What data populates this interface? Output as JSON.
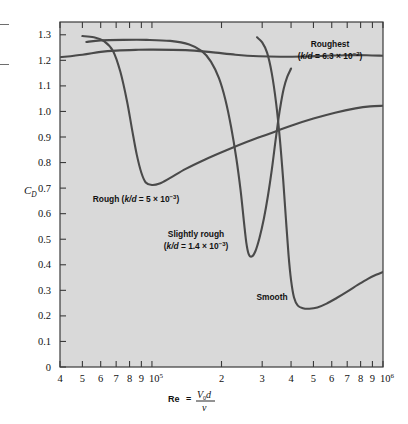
{
  "figure": {
    "background": "#ffffff",
    "plot_background": "#d9d9d9",
    "curve_color": "#4a4a4a",
    "frame_color": "#3a3a3a"
  },
  "chart_data": {
    "type": "line",
    "title": "",
    "subtitle": "",
    "xlabel": "Re = V₀d/ν",
    "xlabel_parts": {
      "prefix": "Re",
      "equals": "=",
      "numerator_v": "V",
      "numerator_sub": "0",
      "numerator_d": "d",
      "denominator": "ν"
    },
    "ylabel": "C_D",
    "ylabel_parts": {
      "main": "C",
      "sub": "D"
    },
    "xscale": "log",
    "yscale": "linear",
    "xlim": [
      40000,
      1000000
    ],
    "ylim": [
      0,
      1.35
    ],
    "grid": false,
    "legend_position": "inline-annotations",
    "ytick_labels": [
      "0",
      "0.1",
      "0.2",
      "0.3",
      "0.4",
      "0.5",
      "0.6",
      "0.7",
      "0.8",
      "0.9",
      "1.0",
      "1.1",
      "1.2",
      "1.3"
    ],
    "ytick_values": [
      0,
      0.1,
      0.2,
      0.3,
      0.4,
      0.5,
      0.6,
      0.7,
      0.8,
      0.9,
      1.0,
      1.1,
      1.2,
      1.3
    ],
    "xtick_labels": [
      "4",
      "5",
      "6",
      "7",
      "8",
      "9",
      "10⁵",
      "2",
      "3",
      "4",
      "5",
      "6",
      "7",
      "8",
      "9",
      "10⁶"
    ],
    "xtick_values": [
      40000,
      50000,
      60000,
      70000,
      80000,
      90000,
      100000,
      200000,
      300000,
      400000,
      500000,
      600000,
      700000,
      800000,
      900000,
      1000000
    ],
    "xtick_decade_labels": [
      {
        "base": "10",
        "exp": "5",
        "value": 100000
      },
      {
        "base": "10",
        "exp": "6",
        "value": 1000000
      }
    ],
    "series": [
      {
        "name": "Roughest",
        "label_line1": "Roughest",
        "label_line2_prefix": "(",
        "label_line2_kd": "k/d",
        "label_line2_rest": " = 6.3 × 10",
        "label_line2_exp": "−2",
        "label_line2_close": ")",
        "roughness_kd": 0.063,
        "points": [
          [
            40000,
            1.212
          ],
          [
            50000,
            1.222
          ],
          [
            60000,
            1.233
          ],
          [
            70000,
            1.238
          ],
          [
            85000,
            1.241
          ],
          [
            100000,
            1.242
          ],
          [
            140000,
            1.24
          ],
          [
            180000,
            1.232
          ],
          [
            230000,
            1.222
          ],
          [
            290000,
            1.216
          ],
          [
            360000,
            1.214
          ],
          [
            450000,
            1.215
          ],
          [
            560000,
            1.218
          ],
          [
            700000,
            1.22
          ],
          [
            850000,
            1.22
          ],
          [
            1000000,
            1.218
          ]
        ]
      },
      {
        "name": "Rough",
        "label_line1_prefix": "Rough (",
        "label_kd": "k/d",
        "label_rest": " = 5 × 10",
        "label_exp": "−3",
        "label_close": ")",
        "roughness_kd": 0.005,
        "points": [
          [
            50000,
            1.295
          ],
          [
            56000,
            1.29
          ],
          [
            62000,
            1.275
          ],
          [
            68000,
            1.235
          ],
          [
            73000,
            1.155
          ],
          [
            78000,
            1.04
          ],
          [
            82000,
            0.93
          ],
          [
            86000,
            0.83
          ],
          [
            90000,
            0.76
          ],
          [
            94000,
            0.722
          ],
          [
            100000,
            0.712
          ],
          [
            108000,
            0.718
          ],
          [
            120000,
            0.74
          ],
          [
            140000,
            0.775
          ],
          [
            170000,
            0.812
          ],
          [
            210000,
            0.848
          ],
          [
            260000,
            0.882
          ],
          [
            320000,
            0.912
          ],
          [
            400000,
            0.944
          ],
          [
            500000,
            0.972
          ],
          [
            620000,
            0.995
          ],
          [
            760000,
            1.012
          ],
          [
            880000,
            1.02
          ],
          [
            1000000,
            1.022
          ]
        ]
      },
      {
        "name": "Slightly rough",
        "label_line1": "Slightly rough",
        "label_line2_prefix": "(",
        "label_line2_kd": "k/d",
        "label_line2_rest": " = 1.4 × 10",
        "label_line2_exp": "−3",
        "label_line2_close": ")",
        "roughness_kd": 0.0014,
        "points": [
          [
            52000,
            1.272
          ],
          [
            60000,
            1.278
          ],
          [
            75000,
            1.28
          ],
          [
            95000,
            1.28
          ],
          [
            120000,
            1.276
          ],
          [
            145000,
            1.262
          ],
          [
            165000,
            1.235
          ],
          [
            180000,
            1.195
          ],
          [
            195000,
            1.13
          ],
          [
            208000,
            1.045
          ],
          [
            220000,
            0.94
          ],
          [
            232000,
            0.815
          ],
          [
            242000,
            0.69
          ],
          [
            250000,
            0.57
          ],
          [
            256000,
            0.488
          ],
          [
            262000,
            0.443
          ],
          [
            270000,
            0.432
          ],
          [
            280000,
            0.452
          ],
          [
            292000,
            0.505
          ],
          [
            305000,
            0.58
          ],
          [
            318000,
            0.672
          ],
          [
            330000,
            0.77
          ],
          [
            342000,
            0.88
          ],
          [
            352000,
            0.965
          ],
          [
            362000,
            1.035
          ],
          [
            372000,
            1.09
          ],
          [
            385000,
            1.135
          ],
          [
            400000,
            1.168
          ]
        ]
      },
      {
        "name": "Smooth",
        "label_line1": "Smooth",
        "points": [
          [
            285000,
            1.29
          ],
          [
            300000,
            1.27
          ],
          [
            315000,
            1.23
          ],
          [
            330000,
            1.15
          ],
          [
            345000,
            1.03
          ],
          [
            358000,
            0.89
          ],
          [
            370000,
            0.73
          ],
          [
            380000,
            0.58
          ],
          [
            390000,
            0.44
          ],
          [
            400000,
            0.34
          ],
          [
            412000,
            0.272
          ],
          [
            428000,
            0.24
          ],
          [
            450000,
            0.23
          ],
          [
            480000,
            0.228
          ],
          [
            520000,
            0.233
          ],
          [
            570000,
            0.248
          ],
          [
            630000,
            0.27
          ],
          [
            700000,
            0.295
          ],
          [
            780000,
            0.322
          ],
          [
            860000,
            0.345
          ],
          [
            940000,
            0.362
          ],
          [
            1000000,
            0.372
          ]
        ]
      }
    ],
    "annotations": [
      {
        "name": "roughest-label",
        "text": "Roughest",
        "x_px": 330,
        "y_px": 47
      },
      {
        "name": "roughest-kd-label",
        "text": "(k/d = 6.3 × 10⁻²)",
        "x_px": 330,
        "y_px": 59
      },
      {
        "name": "rough-label",
        "text": "Rough (k/d = 5 × 10⁻³)",
        "x_px": 136,
        "y_px": 202
      },
      {
        "name": "slightly-rough-label",
        "text": "Slightly rough",
        "x_px": 196,
        "y_px": 237
      },
      {
        "name": "slightly-rough-kd-label",
        "text": "(k/d = 1.4 × 10⁻³)",
        "x_px": 196,
        "y_px": 249
      },
      {
        "name": "smooth-label",
        "text": "Smooth",
        "x_px": 272,
        "y_px": 300
      }
    ]
  }
}
